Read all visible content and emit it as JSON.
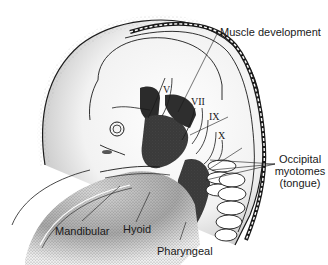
{
  "figure": {
    "labels": {
      "muscle_development": "Muscle development",
      "occipital_line1": "Occipital",
      "occipital_line2": "myotomes",
      "occipital_line3": "(tongue)",
      "mandibular": "Mandibular",
      "hyoid": "Hyoid",
      "pharyngeal": "Pharyngeal"
    },
    "cranial_nerves": {
      "v": "V",
      "vii": "VII",
      "ix": "IX",
      "x": "X"
    },
    "colors": {
      "ink": "#1a1a1a",
      "muscle_dark": "#3a3a3a",
      "stipple": "#8a8a8a",
      "background": "#ffffff"
    }
  }
}
